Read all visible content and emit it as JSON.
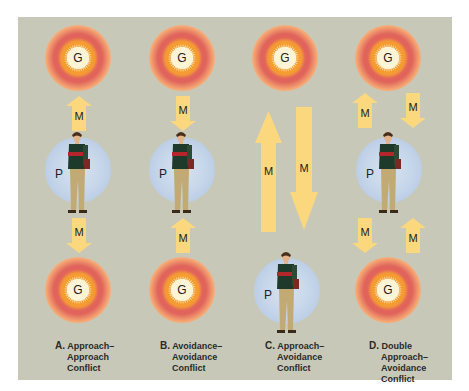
{
  "diagram": {
    "symbols": {
      "goal": "G",
      "person": "P",
      "motive": "M"
    },
    "colors": {
      "background": "#c8c8b8",
      "arrow": "#fbd77e",
      "goal_core": "#fff2cc",
      "goal_ring": "#e0645c",
      "person_halo": "#c6d6ea"
    },
    "panels": [
      {
        "id": "A",
        "letter": "A.",
        "caption_lines": [
          "Approach–",
          "Approach",
          "Conflict"
        ],
        "arrows": [
          "up toward top goal",
          "down toward bottom goal"
        ]
      },
      {
        "id": "B",
        "letter": "B.",
        "caption_lines": [
          "Avoidance–",
          "Avoidance",
          "Conflict"
        ],
        "arrows": [
          "down away from top goal",
          "up away from bottom goal"
        ]
      },
      {
        "id": "C",
        "letter": "C.",
        "caption_lines": [
          "Approach–",
          "Avoidance",
          "Conflict"
        ],
        "arrows": [
          "long up toward goal",
          "long down away from goal"
        ]
      },
      {
        "id": "D",
        "letter": "D.",
        "caption_lines": [
          "Double",
          "Approach–",
          "Avoidance",
          "Conflict"
        ],
        "arrows": [
          "up toward top goal",
          "down away from top goal",
          "down toward bottom goal",
          "up away from bottom goal"
        ]
      }
    ]
  }
}
